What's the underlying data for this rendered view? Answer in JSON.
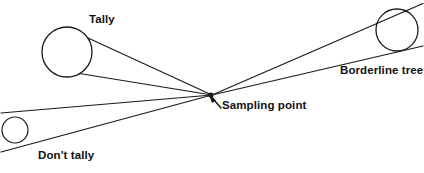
{
  "figure": {
    "stroke_color": "#1a1a1a",
    "background_color": "#ffffff",
    "labels": {
      "tally": "Tally",
      "borderline_tree": "Borderline tree",
      "sampling_point": "Sampling point",
      "dont_tally": "Don't tally"
    },
    "sampling_point": {
      "x": 212,
      "y": 95
    },
    "trees": [
      {
        "name": "tally-tree",
        "cx": 67,
        "cy": 52,
        "r": 25,
        "status": "Tally"
      },
      {
        "name": "borderline-tree",
        "cx": 397,
        "cy": 30,
        "r": 21,
        "status": "Borderline tree"
      },
      {
        "name": "dont-tally-tree",
        "cx": 15,
        "cy": 130,
        "r": 13,
        "status": "Don't tally"
      }
    ],
    "sight_lines": [
      {
        "name": "tally-upper-sight-line",
        "x1": 212,
        "y1": 95,
        "x2": 88,
        "y2": 38
      },
      {
        "name": "tally-lower-sight-line",
        "x1": 212,
        "y1": 95,
        "x2": 80,
        "y2": 73
      },
      {
        "name": "dont-tally-upper-sight-line",
        "x1": 212,
        "y1": 95,
        "x2": 1,
        "y2": 113
      },
      {
        "name": "dont-tally-lower-sight-line",
        "x1": 212,
        "y1": 95,
        "x2": 1,
        "y2": 152
      },
      {
        "name": "borderline-upper-sight-line",
        "x1": 212,
        "y1": 95,
        "x2": 423,
        "y2": 4
      },
      {
        "name": "borderline-lower-sight-line",
        "x1": 212,
        "y1": 95,
        "x2": 423,
        "y2": 46
      }
    ],
    "leader_line": {
      "name": "sampling-point-leader",
      "x1": 221,
      "y1": 108,
      "x2": 210,
      "y2": 96
    }
  }
}
